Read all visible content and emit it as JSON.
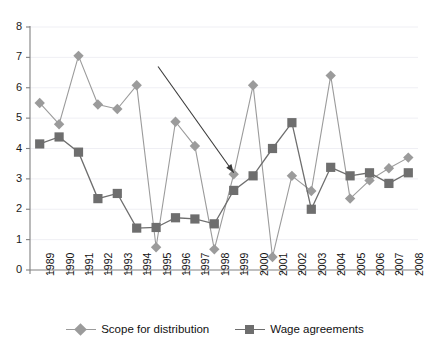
{
  "chart_data": {
    "type": "line",
    "title": "",
    "subtitle": "",
    "xlabel": "",
    "ylabel": "",
    "categories": [
      "1989",
      "1990",
      "1991",
      "1992",
      "1993",
      "1994",
      "1995",
      "1996",
      "1997",
      "1998",
      "1999",
      "2000",
      "2001",
      "2002",
      "2003",
      "2004",
      "2005",
      "2006",
      "2007",
      "2008"
    ],
    "ylim": [
      0,
      8
    ],
    "yticks": [
      0,
      1,
      2,
      3,
      4,
      5,
      6,
      7,
      8
    ],
    "grid": "horizontal",
    "legend_position": "bottom-center",
    "series": [
      {
        "name": "Scope for distribution",
        "marker": "diamond",
        "color": "#9b9b9b",
        "values": [
          5.5,
          4.8,
          7.05,
          5.45,
          5.3,
          6.08,
          0.75,
          4.88,
          4.08,
          0.68,
          3.15,
          6.08,
          0.43,
          3.1,
          2.6,
          6.4,
          2.35,
          2.95,
          3.35,
          3.7
        ]
      },
      {
        "name": "Wage agreements",
        "marker": "square",
        "color": "#6e6e6e",
        "values": [
          4.15,
          4.38,
          3.88,
          2.35,
          2.52,
          1.38,
          1.4,
          1.72,
          1.68,
          1.52,
          2.62,
          3.1,
          4.0,
          4.85,
          2.0,
          3.38,
          3.1,
          3.2,
          2.85,
          3.2
        ]
      }
    ],
    "annotations": [
      {
        "type": "arrow",
        "label": "",
        "from": {
          "x_value": 1995.1,
          "y_value": 6.7
        },
        "to": {
          "x_value": 1999.0,
          "y_value": 3.2
        },
        "color": "#3a3a3a"
      }
    ]
  },
  "legend": {
    "items": [
      {
        "label": "Scope for distribution",
        "marker": "diamond",
        "color": "#9b9b9b"
      },
      {
        "label": "Wage agreements",
        "marker": "square",
        "color": "#6e6e6e"
      }
    ]
  },
  "axis": {
    "y_tick_labels": [
      "8",
      "7",
      "6",
      "5",
      "4",
      "3",
      "2",
      "1",
      "0"
    ],
    "x_tick_labels": [
      "1989",
      "1990",
      "1991",
      "1992",
      "1993",
      "1994",
      "1995",
      "1996",
      "1997",
      "1998",
      "1999",
      "2000",
      "2001",
      "2002",
      "2003",
      "2004",
      "2005",
      "2006",
      "2007",
      "2008"
    ]
  },
  "colors": {
    "series_scope": "#9b9b9b",
    "series_wage": "#6e6e6e",
    "axis": "#808080",
    "grid": "#efeff4",
    "annotation": "#3a3a3a",
    "text": "#111111",
    "background": "#ffffff"
  }
}
